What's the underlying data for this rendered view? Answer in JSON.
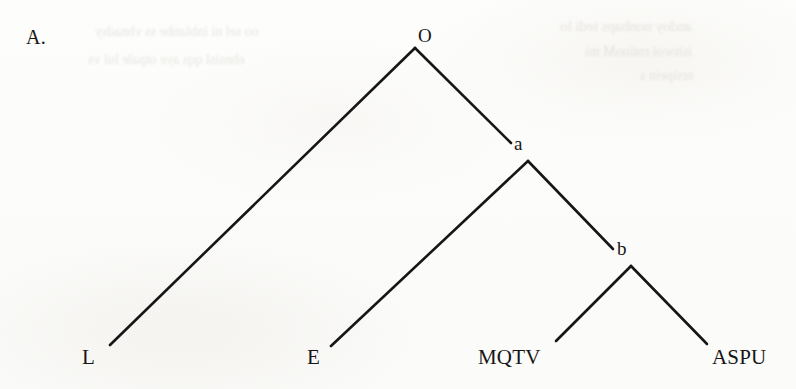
{
  "figure": {
    "panel_label": "A.",
    "diagram_type": "cladogram",
    "background_color": "#fdfdfb",
    "line_color": "#161616",
    "text_color": "#161616"
  },
  "ghost_text": {
    "note": "faint mirrored bleed-through from reverse page; illegible",
    "lines": [
      {
        "text": "andoy nonbaps tedi lo",
        "x": 560,
        "y": 18,
        "size": 15
      },
      {
        "text": "isiswol  rotinoM  mi",
        "x": 585,
        "y": 44,
        "size": 14
      },
      {
        "text": "ntsipein s",
        "x": 640,
        "y": 68,
        "size": 14
      },
      {
        "text": "oo sel ni inblanbe  ss vhnadsy",
        "x": 95,
        "y": 24,
        "size": 14
      },
      {
        "text": "ehnsisl qqs  aye  otpale lul vs",
        "x": 88,
        "y": 52,
        "size": 14
      }
    ]
  },
  "tree": {
    "nodes": [
      {
        "id": "O",
        "label": "O",
        "type": "root",
        "vertex_x": 415,
        "vertex_y": 48,
        "label_x": 418,
        "label_y": 25
      },
      {
        "id": "a",
        "label": "a",
        "type": "internal",
        "vertex_x": 528,
        "vertex_y": 161,
        "label_x": 514,
        "label_y": 133
      },
      {
        "id": "b",
        "label": "b",
        "type": "internal",
        "vertex_x": 631,
        "vertex_y": 266,
        "label_x": 617,
        "label_y": 238
      }
    ],
    "leaves": [
      {
        "id": "L",
        "label": "L",
        "label_x": 82,
        "label_y": 345,
        "tip_x": 110,
        "tip_y": 345
      },
      {
        "id": "E",
        "label": "E",
        "label_x": 307,
        "label_y": 345,
        "tip_x": 331,
        "tip_y": 346
      },
      {
        "id": "MQTV",
        "label": "MQTV",
        "label_x": 478,
        "label_y": 345,
        "tip_x": 556,
        "tip_y": 341
      },
      {
        "id": "ASPU",
        "label": "ASPU",
        "label_x": 712,
        "label_y": 345,
        "tip_x": 707,
        "tip_y": 344
      }
    ],
    "branches": [
      {
        "id": "O-L",
        "from": "O",
        "to": "L",
        "x1": 415,
        "y1": 48,
        "x2": 110,
        "y2": 345
      },
      {
        "id": "O-a",
        "from": "O",
        "to": "a",
        "x1": 415,
        "y1": 48,
        "x2": 511,
        "y2": 143
      },
      {
        "id": "a-E",
        "from": "a",
        "to": "E",
        "x1": 528,
        "y1": 161,
        "x2": 331,
        "y2": 346
      },
      {
        "id": "a-b",
        "from": "a",
        "to": "b",
        "x1": 528,
        "y1": 161,
        "x2": 613,
        "y2": 249
      },
      {
        "id": "b-MQTV",
        "from": "b",
        "to": "MQTV",
        "x1": 631,
        "y1": 266,
        "x2": 556,
        "y2": 341
      },
      {
        "id": "b-ASPU",
        "from": "b",
        "to": "ASPU",
        "x1": 631,
        "y1": 266,
        "x2": 707,
        "y2": 344
      }
    ],
    "stroke_width": 2.6
  }
}
